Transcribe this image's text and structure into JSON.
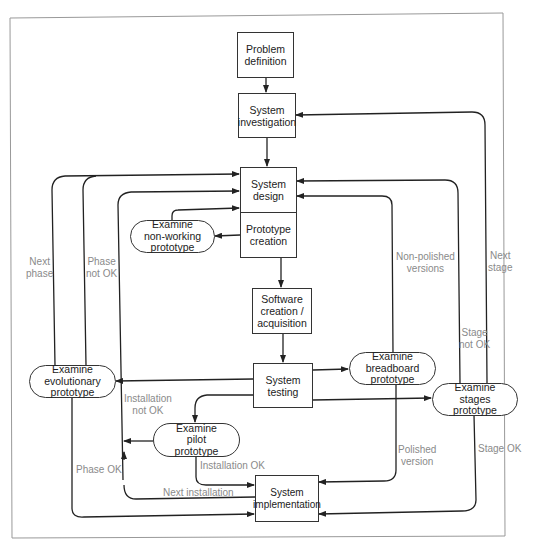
{
  "diagram": {
    "nodes": {
      "problem_definition": "Problem\ndefinition",
      "system_investigation": "System\ninvestigation",
      "system_design": "System\ndesign",
      "prototype_creation": "Prototype\ncreation",
      "software_creation": "Software\ncreation /\nacquisition",
      "system_testing": "System\ntesting",
      "system_implementation": "System\nimplementation",
      "examine_non_working": "Examine\nnon-working\nprototype",
      "examine_evolutionary": "Examine\nevolutionary\nprototype",
      "examine_breadboard": "Examine\nbreadboard\nprototype",
      "examine_stages": "Examine\nstages\nprototype",
      "examine_pilot": "Examine\npilot\nprototype"
    },
    "edge_labels": {
      "next_phase": "Next\nphase",
      "phase_not_ok": "Phase\nnot OK",
      "phase_ok": "Phase OK",
      "installation_not_ok": "Installation\nnot OK",
      "installation_ok": "Installation OK",
      "next_installation": "Next installation",
      "non_polished_versions": "Non-polished\nversions",
      "polished_version": "Polished\nversion",
      "next_stage": "Next\nstage",
      "stage_not_ok": "Stage\nnot OK",
      "stage_ok": "Stage OK"
    },
    "colors": {
      "line": "#222222",
      "label": "#8a8a8a",
      "frame": "#999999"
    }
  }
}
